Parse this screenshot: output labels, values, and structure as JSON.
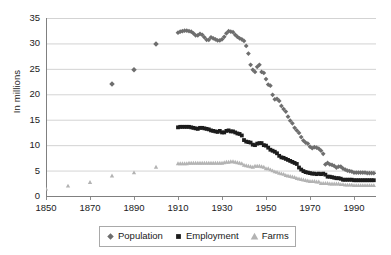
{
  "chart_data": {
    "type": "scatter",
    "title": "",
    "xlabel": "",
    "ylabel": "In millions",
    "xlim": [
      1850,
      2000
    ],
    "ylim": [
      0,
      35
    ],
    "xticks": [
      1850,
      1870,
      1890,
      1910,
      1930,
      1950,
      1970,
      1990
    ],
    "yticks": [
      0,
      5,
      10,
      15,
      20,
      25,
      30,
      35
    ],
    "grid": "horizontal",
    "legend_position": "bottom-center",
    "series": [
      {
        "name": "Population",
        "color": "#6e6e6e",
        "marker": "diamond",
        "points": [
          [
            1880,
            22.0
          ],
          [
            1890,
            24.8
          ],
          [
            1900,
            29.9
          ],
          [
            1910,
            32.1
          ],
          [
            1911,
            32.3
          ],
          [
            1912,
            32.4
          ],
          [
            1913,
            32.5
          ],
          [
            1914,
            32.5
          ],
          [
            1915,
            32.4
          ],
          [
            1916,
            32.3
          ],
          [
            1917,
            32.0
          ],
          [
            1918,
            31.6
          ],
          [
            1919,
            31.6
          ],
          [
            1920,
            31.9
          ],
          [
            1921,
            31.7
          ],
          [
            1922,
            31.2
          ],
          [
            1923,
            30.7
          ],
          [
            1924,
            30.7
          ],
          [
            1925,
            31.2
          ],
          [
            1926,
            31.0
          ],
          [
            1927,
            30.8
          ],
          [
            1928,
            30.6
          ],
          [
            1929,
            30.6
          ],
          [
            1930,
            30.8
          ],
          [
            1931,
            31.3
          ],
          [
            1932,
            32.0
          ],
          [
            1933,
            32.4
          ],
          [
            1934,
            32.3
          ],
          [
            1935,
            32.2
          ],
          [
            1936,
            31.7
          ],
          [
            1937,
            31.3
          ],
          [
            1938,
            31.0
          ],
          [
            1939,
            30.8
          ],
          [
            1940,
            30.5
          ],
          [
            1941,
            29.5
          ],
          [
            1942,
            28.0
          ],
          [
            1943,
            25.8
          ],
          [
            1944,
            24.8
          ],
          [
            1945,
            24.4
          ],
          [
            1946,
            25.4
          ],
          [
            1947,
            25.8
          ],
          [
            1948,
            24.4
          ],
          [
            1949,
            24.2
          ],
          [
            1950,
            23.0
          ],
          [
            1951,
            21.9
          ],
          [
            1952,
            21.7
          ],
          [
            1953,
            19.9
          ],
          [
            1954,
            19.0
          ],
          [
            1955,
            19.1
          ],
          [
            1956,
            18.7
          ],
          [
            1957,
            17.7
          ],
          [
            1958,
            17.1
          ],
          [
            1959,
            16.6
          ],
          [
            1960,
            15.6
          ],
          [
            1961,
            14.8
          ],
          [
            1962,
            14.3
          ],
          [
            1963,
            13.4
          ],
          [
            1964,
            12.9
          ],
          [
            1965,
            12.4
          ],
          [
            1966,
            11.6
          ],
          [
            1967,
            10.9
          ],
          [
            1968,
            10.5
          ],
          [
            1969,
            10.3
          ],
          [
            1970,
            9.7
          ],
          [
            1971,
            9.4
          ],
          [
            1972,
            9.6
          ],
          [
            1973,
            9.5
          ],
          [
            1974,
            9.3
          ],
          [
            1975,
            8.9
          ],
          [
            1976,
            8.3
          ],
          [
            1977,
            6.2
          ],
          [
            1978,
            6.5
          ],
          [
            1979,
            6.2
          ],
          [
            1980,
            6.1
          ],
          [
            1981,
            5.9
          ],
          [
            1982,
            5.6
          ],
          [
            1983,
            5.8
          ],
          [
            1984,
            5.8
          ],
          [
            1985,
            5.4
          ],
          [
            1986,
            5.2
          ],
          [
            1987,
            5.0
          ],
          [
            1988,
            4.9
          ],
          [
            1989,
            4.8
          ],
          [
            1990,
            4.6
          ],
          [
            1991,
            4.6
          ],
          [
            1992,
            4.6
          ],
          [
            1993,
            4.6
          ],
          [
            1994,
            4.6
          ],
          [
            1995,
            4.6
          ],
          [
            1996,
            4.5
          ],
          [
            1997,
            4.5
          ],
          [
            1998,
            4.5
          ],
          [
            1999,
            4.5
          ]
        ]
      },
      {
        "name": "Employment",
        "color": "#1c1c1c",
        "marker": "square",
        "points": [
          [
            1910,
            13.5
          ],
          [
            1911,
            13.6
          ],
          [
            1912,
            13.6
          ],
          [
            1913,
            13.6
          ],
          [
            1914,
            13.6
          ],
          [
            1915,
            13.6
          ],
          [
            1916,
            13.5
          ],
          [
            1917,
            13.4
          ],
          [
            1918,
            13.3
          ],
          [
            1919,
            13.2
          ],
          [
            1920,
            13.4
          ],
          [
            1921,
            13.4
          ],
          [
            1922,
            13.3
          ],
          [
            1923,
            13.2
          ],
          [
            1924,
            13.1
          ],
          [
            1925,
            12.9
          ],
          [
            1926,
            12.8
          ],
          [
            1927,
            12.7
          ],
          [
            1928,
            12.6
          ],
          [
            1929,
            12.8
          ],
          [
            1930,
            12.5
          ],
          [
            1931,
            12.5
          ],
          [
            1932,
            12.8
          ],
          [
            1933,
            12.9
          ],
          [
            1934,
            12.7
          ],
          [
            1935,
            12.7
          ],
          [
            1936,
            12.5
          ],
          [
            1937,
            12.3
          ],
          [
            1938,
            12.2
          ],
          [
            1939,
            11.9
          ],
          [
            1940,
            11.0
          ],
          [
            1941,
            10.7
          ],
          [
            1942,
            10.6
          ],
          [
            1943,
            10.5
          ],
          [
            1944,
            10.1
          ],
          [
            1945,
            10.0
          ],
          [
            1946,
            10.3
          ],
          [
            1947,
            10.4
          ],
          [
            1948,
            10.4
          ],
          [
            1949,
            10.0
          ],
          [
            1950,
            9.9
          ],
          [
            1951,
            9.5
          ],
          [
            1952,
            9.1
          ],
          [
            1953,
            8.9
          ],
          [
            1954,
            8.7
          ],
          [
            1955,
            8.4
          ],
          [
            1956,
            7.9
          ],
          [
            1957,
            7.6
          ],
          [
            1958,
            7.5
          ],
          [
            1959,
            7.3
          ],
          [
            1960,
            7.1
          ],
          [
            1961,
            6.9
          ],
          [
            1962,
            6.7
          ],
          [
            1963,
            6.5
          ],
          [
            1964,
            6.3
          ],
          [
            1965,
            5.6
          ],
          [
            1966,
            5.2
          ],
          [
            1967,
            4.9
          ],
          [
            1968,
            4.7
          ],
          [
            1969,
            4.6
          ],
          [
            1970,
            4.5
          ],
          [
            1971,
            4.4
          ],
          [
            1972,
            4.4
          ],
          [
            1973,
            4.3
          ],
          [
            1974,
            4.4
          ],
          [
            1975,
            4.3
          ],
          [
            1976,
            4.4
          ],
          [
            1977,
            4.2
          ],
          [
            1978,
            3.8
          ],
          [
            1979,
            3.8
          ],
          [
            1980,
            3.7
          ],
          [
            1981,
            3.6
          ],
          [
            1982,
            3.5
          ],
          [
            1983,
            3.5
          ],
          [
            1984,
            3.4
          ],
          [
            1985,
            3.2
          ],
          [
            1986,
            3.2
          ],
          [
            1987,
            3.2
          ],
          [
            1988,
            3.2
          ],
          [
            1989,
            3.2
          ],
          [
            1990,
            3.1
          ],
          [
            1991,
            3.1
          ],
          [
            1992,
            3.1
          ],
          [
            1993,
            3.1
          ],
          [
            1994,
            3.1
          ],
          [
            1995,
            3.1
          ],
          [
            1996,
            3.1
          ],
          [
            1997,
            3.1
          ],
          [
            1998,
            3.1
          ],
          [
            1999,
            3.1
          ]
        ]
      },
      {
        "name": "Farms",
        "color": "#b3b3b3",
        "marker": "triangle",
        "points": [
          [
            1850,
            1.4
          ],
          [
            1860,
            2.0
          ],
          [
            1870,
            2.7
          ],
          [
            1880,
            4.0
          ],
          [
            1890,
            4.6
          ],
          [
            1900,
            5.7
          ],
          [
            1910,
            6.4
          ],
          [
            1911,
            6.4
          ],
          [
            1912,
            6.4
          ],
          [
            1913,
            6.4
          ],
          [
            1914,
            6.4
          ],
          [
            1915,
            6.5
          ],
          [
            1916,
            6.5
          ],
          [
            1917,
            6.5
          ],
          [
            1918,
            6.5
          ],
          [
            1919,
            6.5
          ],
          [
            1920,
            6.5
          ],
          [
            1921,
            6.5
          ],
          [
            1922,
            6.5
          ],
          [
            1923,
            6.5
          ],
          [
            1924,
            6.5
          ],
          [
            1925,
            6.5
          ],
          [
            1926,
            6.5
          ],
          [
            1927,
            6.5
          ],
          [
            1928,
            6.5
          ],
          [
            1929,
            6.5
          ],
          [
            1930,
            6.5
          ],
          [
            1931,
            6.6
          ],
          [
            1932,
            6.7
          ],
          [
            1933,
            6.7
          ],
          [
            1934,
            6.8
          ],
          [
            1935,
            6.8
          ],
          [
            1936,
            6.7
          ],
          [
            1937,
            6.6
          ],
          [
            1938,
            6.5
          ],
          [
            1939,
            6.4
          ],
          [
            1940,
            6.1
          ],
          [
            1941,
            6.0
          ],
          [
            1942,
            5.9
          ],
          [
            1943,
            5.8
          ],
          [
            1944,
            5.7
          ],
          [
            1945,
            5.9
          ],
          [
            1946,
            5.9
          ],
          [
            1947,
            5.9
          ],
          [
            1948,
            5.8
          ],
          [
            1949,
            5.7
          ],
          [
            1950,
            5.4
          ],
          [
            1951,
            5.4
          ],
          [
            1952,
            5.2
          ],
          [
            1953,
            5.0
          ],
          [
            1954,
            4.8
          ],
          [
            1955,
            4.7
          ],
          [
            1956,
            4.5
          ],
          [
            1957,
            4.4
          ],
          [
            1958,
            4.3
          ],
          [
            1959,
            4.1
          ],
          [
            1960,
            4.0
          ],
          [
            1961,
            3.9
          ],
          [
            1962,
            3.8
          ],
          [
            1963,
            3.7
          ],
          [
            1964,
            3.5
          ],
          [
            1965,
            3.4
          ],
          [
            1966,
            3.3
          ],
          [
            1967,
            3.2
          ],
          [
            1968,
            3.1
          ],
          [
            1969,
            3.0
          ],
          [
            1970,
            2.9
          ],
          [
            1971,
            2.9
          ],
          [
            1972,
            2.9
          ],
          [
            1973,
            2.8
          ],
          [
            1974,
            2.8
          ],
          [
            1975,
            2.5
          ],
          [
            1976,
            2.5
          ],
          [
            1977,
            2.5
          ],
          [
            1978,
            2.5
          ],
          [
            1979,
            2.4
          ],
          [
            1980,
            2.4
          ],
          [
            1981,
            2.4
          ],
          [
            1982,
            2.4
          ],
          [
            1983,
            2.4
          ],
          [
            1984,
            2.3
          ],
          [
            1985,
            2.3
          ],
          [
            1986,
            2.2
          ],
          [
            1987,
            2.2
          ],
          [
            1988,
            2.2
          ],
          [
            1989,
            2.2
          ],
          [
            1990,
            2.1
          ],
          [
            1991,
            2.1
          ],
          [
            1992,
            2.1
          ],
          [
            1993,
            2.1
          ],
          [
            1994,
            2.1
          ],
          [
            1995,
            2.1
          ],
          [
            1996,
            2.1
          ],
          [
            1997,
            2.1
          ],
          [
            1998,
            2.1
          ],
          [
            1999,
            2.1
          ]
        ]
      }
    ]
  },
  "axis": {
    "ylabel": "In millions",
    "yticks": [
      "0",
      "5",
      "10",
      "15",
      "20",
      "25",
      "30",
      "35"
    ],
    "xticks": [
      "1850",
      "1870",
      "1890",
      "1910",
      "1930",
      "1950",
      "1970",
      "1990"
    ]
  },
  "legend": {
    "items": [
      {
        "label": "Population",
        "color": "#6e6e6e",
        "marker": "diamond"
      },
      {
        "label": "Employment",
        "color": "#1c1c1c",
        "marker": "square"
      },
      {
        "label": "Farms",
        "color": "#b3b3b3",
        "marker": "triangle"
      }
    ]
  },
  "colors": {
    "grid": "#c8c8c8",
    "axis": "#808080",
    "background": "#ffffff"
  }
}
